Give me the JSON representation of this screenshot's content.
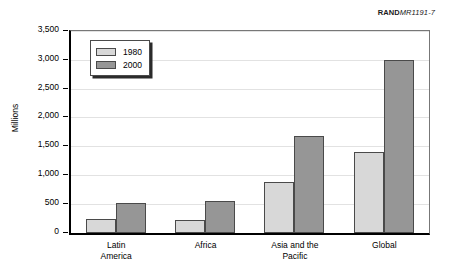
{
  "credit": {
    "org": "RAND",
    "code": "MR1191-7"
  },
  "chart_data": {
    "type": "bar",
    "title": "",
    "xlabel": "",
    "ylabel": "Millions",
    "ylim": [
      0,
      3500
    ],
    "ytick_step": 500,
    "grid": true,
    "legend_position": "top-left",
    "categories": [
      "Latin America",
      "Africa",
      "Asia and the Pacific",
      "Global"
    ],
    "category_lines": [
      [
        "Latin",
        "America"
      ],
      [
        "Africa"
      ],
      [
        "Asia and the",
        "Pacific"
      ],
      [
        "Global"
      ]
    ],
    "ytick_labels": [
      "0",
      "500",
      "1,000",
      "1,500",
      "2,000",
      "2,500",
      "3,000",
      "3,500"
    ],
    "ytick_values": [
      0,
      500,
      1000,
      1500,
      2000,
      2500,
      3000,
      3500
    ],
    "series": [
      {
        "name": "1980",
        "color": "#d8d8d8",
        "values": [
          250,
          220,
          880,
          1400
        ]
      },
      {
        "name": "2000",
        "color": "#969696",
        "values": [
          530,
          550,
          1680,
          3000
        ]
      }
    ]
  }
}
